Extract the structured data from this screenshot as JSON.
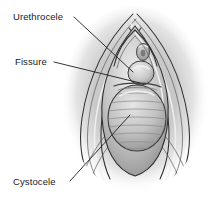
{
  "illustration": {
    "title": "Female pelvic organ prolapse — vaginal introitus view",
    "style": "grayscale medical line-and-wash illustration",
    "background_color": "#ffffff",
    "canvas": {
      "width": 220,
      "height": 199
    }
  },
  "labels": [
    {
      "id": "urethrocele",
      "text": "Urethrocele",
      "text_x": 13,
      "text_y": 20,
      "leader_from_x": 74,
      "leader_from_y": 17,
      "leader_to_x": 133,
      "leader_to_y": 72,
      "target": "urethral bulge below meatus"
    },
    {
      "id": "fissure",
      "text": "Fissure",
      "text_x": 15,
      "text_y": 65,
      "leader_from_x": 54,
      "leader_from_y": 62,
      "leader_to_x": 140,
      "leader_to_y": 83,
      "target": "cleft between urethrocele and cystocele"
    },
    {
      "id": "cystocele",
      "text": "Cystocele",
      "text_x": 13,
      "text_y": 185,
      "leader_from_x": 70,
      "leader_from_y": 181,
      "leader_to_x": 130,
      "leader_to_y": 115,
      "target": "large anterior vaginal wall bulge with rugae"
    }
  ],
  "anatomy": {
    "urethral_meatus": {
      "cx": 143,
      "cy": 52,
      "rx": 6,
      "ry": 8
    },
    "urethrocele_bulge": {
      "cx": 141,
      "cy": 73,
      "rx": 13,
      "ry": 12
    },
    "cystocele_mass": {
      "cx": 137,
      "cy": 118,
      "rx": 29,
      "ry": 33
    },
    "rugae_count": 9,
    "labial_fold_count": 5
  },
  "colors": {
    "ink": "#1d1d1d",
    "contour": "#2e2e2e",
    "tissue_light": "#d8d8d8",
    "tissue_mid": "#b4b4b4",
    "tissue_dark": "#8a8a8a",
    "shadow": "#6a6a6a",
    "highlight": "#f2f2f2",
    "background": "#ffffff"
  }
}
